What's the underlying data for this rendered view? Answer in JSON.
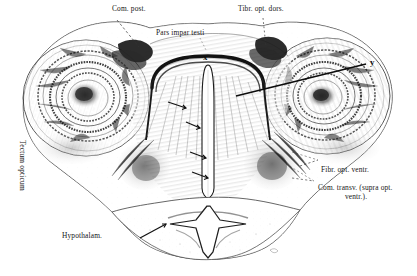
{
  "figure": {
    "kind": "histological-drawing",
    "background_color": "#ffffff",
    "ink_color": "#1a1a1a"
  },
  "labels": {
    "com_post": "Com. post.",
    "tibr_opt_dors": "Tibr. opt. dors.",
    "pars_impar_testi": "Pars impar testi",
    "tectum_opticum": "Tectum opticum",
    "hypothalam": "Hypothalam.",
    "fibr_opt_ventr": "Fibr. opt. ventr.",
    "com_transv_line1": "Com. transv. (supra opt.",
    "com_transv_line2": "ventr.)."
  },
  "markers": {
    "x": "x",
    "y": "y"
  }
}
